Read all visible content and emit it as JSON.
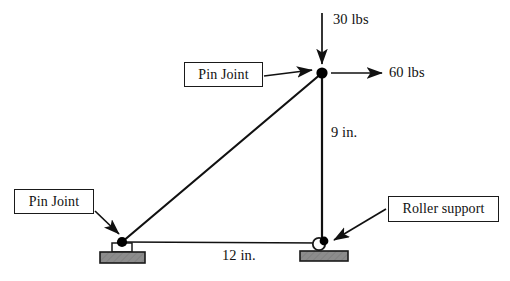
{
  "figure": {
    "colors": {
      "line": "#111111",
      "support_fill": "#8c8c8c",
      "support_stroke": "#1a1a1a",
      "joint_fill": "#000000",
      "background": "#ffffff",
      "label_border": "#1a1a1a"
    },
    "callouts": [
      {
        "id": "pin-joint-top",
        "label": "Pin Joint"
      },
      {
        "id": "pin-joint-left",
        "label": "Pin Joint"
      },
      {
        "id": "roller-support",
        "label": "Roller support"
      }
    ],
    "loads": [
      {
        "id": "vertical-load",
        "label": "30 lbs",
        "direction": "down",
        "applied_at": "apex-joint"
      },
      {
        "id": "horizontal-load",
        "label": "60 lbs",
        "direction": "right",
        "applied_at": "apex-joint"
      }
    ],
    "dimensions": [
      {
        "id": "vertical-dimension",
        "label": "9 in.",
        "member": "vertical-member"
      },
      {
        "id": "horizontal-dimension",
        "label": "12 in.",
        "member": "bottom-chord"
      }
    ],
    "nodes": [
      {
        "id": "apex-joint",
        "type": "pin",
        "x": 322,
        "y": 73
      },
      {
        "id": "left-pin-joint",
        "type": "pin",
        "x": 122,
        "y": 242
      },
      {
        "id": "roller-joint",
        "type": "roller",
        "x": 322,
        "y": 243
      }
    ],
    "members": [
      {
        "id": "diagonal-member",
        "from": "left-pin-joint",
        "to": "apex-joint"
      },
      {
        "id": "vertical-member",
        "from": "apex-joint",
        "to": "roller-joint"
      },
      {
        "id": "bottom-chord",
        "from": "left-pin-joint",
        "to": "roller-joint"
      }
    ]
  }
}
